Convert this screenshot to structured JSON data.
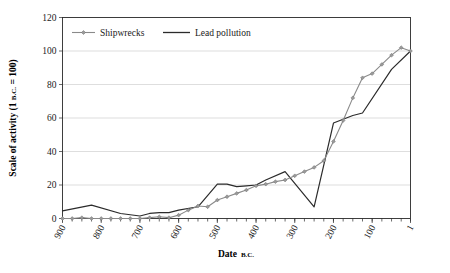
{
  "chart_data": {
    "type": "line",
    "title": "",
    "xlabel": "Date B.C.",
    "xlabel_main": "Date",
    "xlabel_suffix": "B.C.",
    "ylabel": "Scale of activity (1 B.C. = 100)",
    "ylabel_main": "Scale of activity (1 ",
    "ylabel_sc": "B.C.",
    "ylabel_tail": " = 100)",
    "ylim": [
      0,
      120
    ],
    "ytick_values": [
      0,
      20,
      40,
      60,
      80,
      100,
      120
    ],
    "ytick_labels": [
      "0",
      "20",
      "40",
      "60",
      "80",
      "100",
      "120"
    ],
    "xlim": [
      900,
      1
    ],
    "x_axis_direction": "descending",
    "xtick_labels": [
      "900",
      "800",
      "700",
      "600",
      "500",
      "400",
      "300",
      "200",
      "100",
      "1"
    ],
    "xtick_values": [
      900,
      800,
      700,
      600,
      500,
      400,
      300,
      200,
      100,
      1
    ],
    "xminor_step": 25,
    "grid": "horizontal",
    "legend_position": "top-left-inside",
    "series": [
      {
        "name": "Shipwrecks",
        "color": "#8a8a8a",
        "marker": "diamond",
        "x": [
          900,
          875,
          850,
          825,
          800,
          775,
          750,
          725,
          700,
          675,
          650,
          625,
          600,
          575,
          550,
          525,
          500,
          475,
          450,
          425,
          400,
          375,
          350,
          325,
          300,
          275,
          250,
          225,
          200,
          175,
          150,
          125,
          100,
          75,
          50,
          25,
          1
        ],
        "values": [
          0,
          0,
          0.5,
          0,
          0,
          0,
          0,
          0,
          0,
          0.5,
          1,
          0.5,
          2,
          5,
          7.5,
          7,
          11,
          13,
          15,
          17,
          19.5,
          20.5,
          22,
          23,
          25.5,
          28,
          30.5,
          34.5,
          46,
          58.5,
          72,
          84,
          86.5,
          92,
          97.5,
          102,
          100
        ]
      },
      {
        "name": "Lead pollution",
        "color": "#2b2b2b",
        "marker": "none",
        "x": [
          900,
          825,
          750,
          700,
          675,
          650,
          625,
          600,
          550,
          500,
          475,
          450,
          425,
          400,
          375,
          325,
          250,
          200,
          150,
          125,
          50,
          1
        ],
        "values": [
          4.5,
          8,
          3,
          1.5,
          3,
          3.5,
          3.5,
          5,
          7,
          20.5,
          20.5,
          19,
          19.5,
          20,
          23,
          28,
          7,
          57,
          61.5,
          63,
          89,
          100
        ]
      }
    ]
  },
  "legend": {
    "items": [
      {
        "label": "Shipwrecks",
        "color": "#8a8a8a",
        "marker": "diamond"
      },
      {
        "label": "Lead pollution",
        "color": "#2b2b2b",
        "marker": "line"
      }
    ]
  },
  "colors": {
    "shipwrecks": "#8a8a8a",
    "lead_pollution": "#2b2b2b",
    "grid": "#c8c8c8",
    "axis": "#2b2b2b",
    "background": "#ffffff"
  }
}
